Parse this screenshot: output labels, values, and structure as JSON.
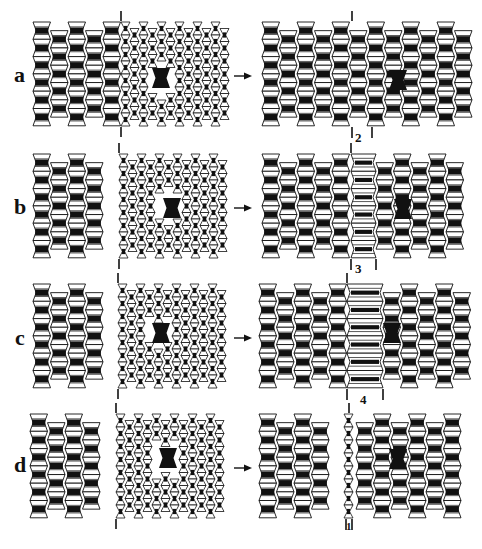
{
  "figure": {
    "colors": {
      "ink": "#111111",
      "fill": "#ffffff",
      "defect": "#000000"
    },
    "arrow_glyph": "→",
    "rows": [
      {
        "label": "a",
        "y": 22,
        "before": {
          "x": 33,
          "width": 195,
          "boundary_x": 121,
          "defect": {
            "x": 161,
            "y": 78
          }
        },
        "after": {
          "x": 262,
          "width": 212,
          "boundary_x": 352,
          "wide_band": null,
          "defect": {
            "x": 398,
            "y": 80
          },
          "marker": {
            "text": "2",
            "x1": 352,
            "x2": 372
          }
        }
      },
      {
        "label": "b",
        "y": 154,
        "before": {
          "x": 33,
          "width": 195,
          "boundary_x": 119,
          "defect": {
            "x": 172,
            "y": 208
          }
        },
        "after": {
          "x": 262,
          "width": 212,
          "boundary_x": 351,
          "wide_band": {
            "x1": 351,
            "x2": 376
          },
          "defect": {
            "x": 403,
            "y": 209
          },
          "marker": {
            "text": "3",
            "x1": 351,
            "x2": 376
          }
        }
      },
      {
        "label": "c",
        "y": 284,
        "before": {
          "x": 33,
          "width": 195,
          "boundary_x": 118,
          "defect": {
            "x": 161,
            "y": 333
          }
        },
        "after": {
          "x": 259,
          "width": 215,
          "boundary_x": 347,
          "wide_band": {
            "x1": 347,
            "x2": 383
          },
          "defect": {
            "x": 392,
            "y": 333
          },
          "marker": {
            "text": "4",
            "x1": 347,
            "x2": 383
          }
        }
      },
      {
        "label": "d",
        "y": 414,
        "before": {
          "x": 30,
          "width": 195,
          "boundary_x": 116,
          "defect": {
            "x": 168,
            "y": 458
          }
        },
        "after": {
          "x": 259,
          "width": 215,
          "boundary_x": 349,
          "narrow_band": {
            "x1": 344,
            "x2": 356
          },
          "defect": {
            "x": 398,
            "y": 459
          },
          "marker": {
            "text": "1",
            "x1": 346,
            "x2": 352
          }
        }
      }
    ]
  },
  "labels": {
    "row_a": "a",
    "row_b": "b",
    "row_c": "c",
    "row_d": "d",
    "marker_2": "2",
    "marker_3": "3",
    "marker_4": "4",
    "marker_1": "1"
  }
}
